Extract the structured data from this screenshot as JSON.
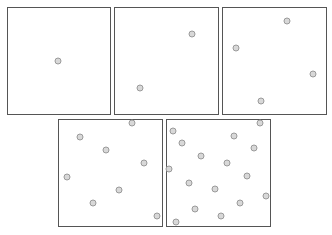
{
  "figure": {
    "panel_style": {
      "border_color": "#555555",
      "dot_fill": "#d8d8d8",
      "dot_stroke": "#9a9a9a"
    },
    "panels": [
      {
        "id": "panel-1",
        "box": [
          7,
          7,
          104,
          108
        ],
        "dots": [
          [
            58,
            61
          ]
        ]
      },
      {
        "id": "panel-2",
        "box": [
          114,
          7,
          105,
          108
        ],
        "dots": [
          [
            192,
            34
          ],
          [
            140,
            88
          ]
        ]
      },
      {
        "id": "panel-3",
        "box": [
          222,
          7,
          105,
          108
        ],
        "dots": [
          [
            287,
            21
          ],
          [
            236,
            48
          ],
          [
            313,
            74
          ],
          [
            261,
            101
          ]
        ]
      },
      {
        "id": "panel-4",
        "box": [
          58,
          119,
          105,
          108
        ],
        "dots": [
          [
            132,
            123
          ],
          [
            80,
            137
          ],
          [
            106,
            150
          ],
          [
            144,
            163
          ],
          [
            67,
            177
          ],
          [
            119,
            190
          ],
          [
            93,
            203
          ],
          [
            157,
            216
          ]
        ]
      },
      {
        "id": "panel-5",
        "box": [
          166,
          119,
          105,
          108
        ],
        "dots": [
          [
            260,
            123
          ],
          [
            173,
            131
          ],
          [
            234,
            136
          ],
          [
            182,
            143
          ],
          [
            254,
            148
          ],
          [
            201,
            156
          ],
          [
            227,
            163
          ],
          [
            169,
            169
          ],
          [
            247,
            176
          ],
          [
            189,
            183
          ],
          [
            215,
            189
          ],
          [
            266,
            196
          ],
          [
            240,
            203
          ],
          [
            195,
            209
          ],
          [
            221,
            216
          ],
          [
            176,
            222
          ]
        ]
      }
    ],
    "caption": ""
  }
}
